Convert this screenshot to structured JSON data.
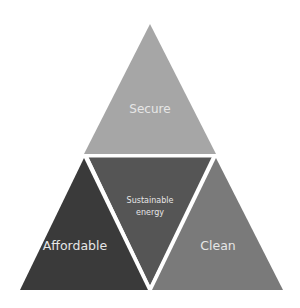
{
  "diagram": {
    "type": "triangle-pyramid",
    "segments": [
      {
        "id": "top",
        "label": "Secure",
        "color": "#a6a6a6"
      },
      {
        "id": "left",
        "label": "Affordable",
        "color": "#3a3a3a"
      },
      {
        "id": "center",
        "label_line1": "Sustainable",
        "label_line2": "energy",
        "color": "#555555"
      },
      {
        "id": "right",
        "label": "Clean",
        "color": "#7a7a7a"
      }
    ]
  }
}
